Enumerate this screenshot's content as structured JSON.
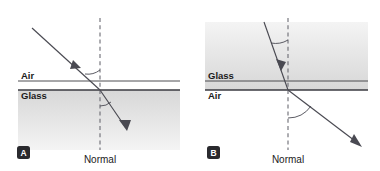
{
  "figure": {
    "background_color": "#ffffff",
    "ray_color": "#4a4a52",
    "line_color": "#3a3a40",
    "glass_fill_top": "#d9d9d9",
    "glass_fill_bottom": "#f2f2f2"
  },
  "panels": [
    {
      "id": "A",
      "badge_label": "A",
      "upper_medium": "Air",
      "lower_medium": "Glass",
      "normal_label": "Normal",
      "description": "Light travelling from air into glass bends toward the normal",
      "incident_medium": "Air",
      "refracted_medium": "Glass",
      "bend_direction": "toward the normal"
    },
    {
      "id": "B",
      "badge_label": "B",
      "upper_medium": "Glass",
      "lower_medium": "Air",
      "normal_label": "Normal",
      "description": "Light travelling from glass into air bends away from the normal",
      "incident_medium": "Glass",
      "refracted_medium": "Air",
      "bend_direction": "away from the normal"
    }
  ]
}
